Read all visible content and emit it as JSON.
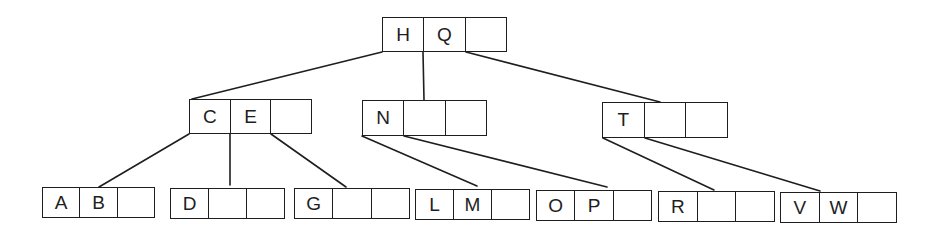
{
  "diagram": {
    "type": "b-tree",
    "colors": {
      "stroke": "#1e1e1e",
      "background": "#ffffff"
    },
    "nodes": [
      {
        "id": "root",
        "keys": [
          "H",
          "Q",
          ""
        ],
        "x": 382,
        "y": 17,
        "w": 125,
        "h": 35
      },
      {
        "id": "ce",
        "keys": [
          "C",
          "E",
          ""
        ],
        "x": 189,
        "y": 99,
        "w": 123,
        "h": 35
      },
      {
        "id": "n",
        "keys": [
          "N",
          "",
          ""
        ],
        "x": 362,
        "y": 100,
        "w": 125,
        "h": 36
      },
      {
        "id": "t",
        "keys": [
          "T",
          "",
          ""
        ],
        "x": 602,
        "y": 102,
        "w": 126,
        "h": 36
      },
      {
        "id": "ab",
        "keys": [
          "A",
          "B",
          ""
        ],
        "x": 42,
        "y": 187,
        "w": 113,
        "h": 31
      },
      {
        "id": "d",
        "keys": [
          "D",
          "",
          ""
        ],
        "x": 170,
        "y": 188,
        "w": 115,
        "h": 31
      },
      {
        "id": "g",
        "keys": [
          "G",
          "",
          ""
        ],
        "x": 294,
        "y": 188,
        "w": 116,
        "h": 31
      },
      {
        "id": "lm",
        "keys": [
          "L",
          "M",
          ""
        ],
        "x": 415,
        "y": 189,
        "w": 115,
        "h": 31
      },
      {
        "id": "op",
        "keys": [
          "O",
          "P",
          ""
        ],
        "x": 536,
        "y": 190,
        "w": 116,
        "h": 31
      },
      {
        "id": "r",
        "keys": [
          "R",
          "",
          ""
        ],
        "x": 658,
        "y": 191,
        "w": 117,
        "h": 31
      },
      {
        "id": "vw",
        "keys": [
          "V",
          "W",
          ""
        ],
        "x": 780,
        "y": 192,
        "w": 117,
        "h": 31
      }
    ],
    "edges": [
      {
        "from": "root",
        "to": "ce",
        "x1": 382,
        "y1": 52,
        "x2": 192,
        "y2": 99
      },
      {
        "from": "root",
        "to": "n",
        "x1": 423,
        "y1": 52,
        "x2": 424,
        "y2": 100
      },
      {
        "from": "root",
        "to": "t",
        "x1": 466,
        "y1": 52,
        "x2": 660,
        "y2": 102
      },
      {
        "from": "ce",
        "to": "ab",
        "x1": 189,
        "y1": 134,
        "x2": 99,
        "y2": 187
      },
      {
        "from": "ce",
        "to": "d",
        "x1": 230,
        "y1": 134,
        "x2": 230,
        "y2": 185
      },
      {
        "from": "ce",
        "to": "g",
        "x1": 271,
        "y1": 134,
        "x2": 346,
        "y2": 187
      },
      {
        "from": "n",
        "to": "lm",
        "x1": 362,
        "y1": 136,
        "x2": 477,
        "y2": 186
      },
      {
        "from": "n",
        "to": "op",
        "x1": 404,
        "y1": 136,
        "x2": 607,
        "y2": 187
      },
      {
        "from": "t",
        "to": "r",
        "x1": 603,
        "y1": 138,
        "x2": 714,
        "y2": 190
      },
      {
        "from": "t",
        "to": "vw",
        "x1": 645,
        "y1": 138,
        "x2": 820,
        "y2": 191
      }
    ]
  }
}
